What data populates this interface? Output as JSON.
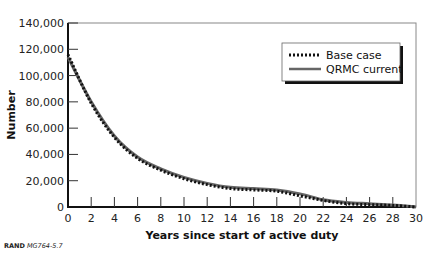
{
  "chart_data": {
    "type": "line",
    "title": "",
    "xlabel": "Years since start of active duty",
    "ylabel": "Number",
    "xlim": [
      0,
      30
    ],
    "ylim": [
      0,
      140000
    ],
    "x_ticks": [
      0,
      2,
      4,
      6,
      8,
      10,
      12,
      14,
      16,
      18,
      20,
      22,
      24,
      26,
      28,
      30
    ],
    "y_ticks": [
      0,
      20000,
      40000,
      60000,
      80000,
      100000,
      120000,
      140000
    ],
    "y_tick_labels": [
      "0",
      "20,000",
      "40,000",
      "60,000",
      "80,000",
      "100,000",
      "120,000",
      "140,000"
    ],
    "grid": false,
    "legend_position": "upper right",
    "x": [
      0,
      2,
      4,
      6,
      8,
      10,
      12,
      14,
      16,
      18,
      20,
      22,
      24,
      26,
      28,
      30
    ],
    "series": [
      {
        "name": "Base case",
        "style": "dotted",
        "values": [
          116000,
          79000,
          53000,
          37000,
          28000,
          21500,
          17000,
          14000,
          13000,
          12000,
          8500,
          5000,
          2500,
          1800,
          1200,
          0
        ]
      },
      {
        "name": "QRMC current",
        "style": "solid",
        "values": [
          114000,
          80000,
          54000,
          38000,
          29000,
          22500,
          18000,
          15000,
          14000,
          13000,
          10000,
          5500,
          3500,
          2500,
          1500,
          0
        ]
      }
    ]
  },
  "source_note": {
    "org": "RAND",
    "id": "MG764-5.7"
  }
}
